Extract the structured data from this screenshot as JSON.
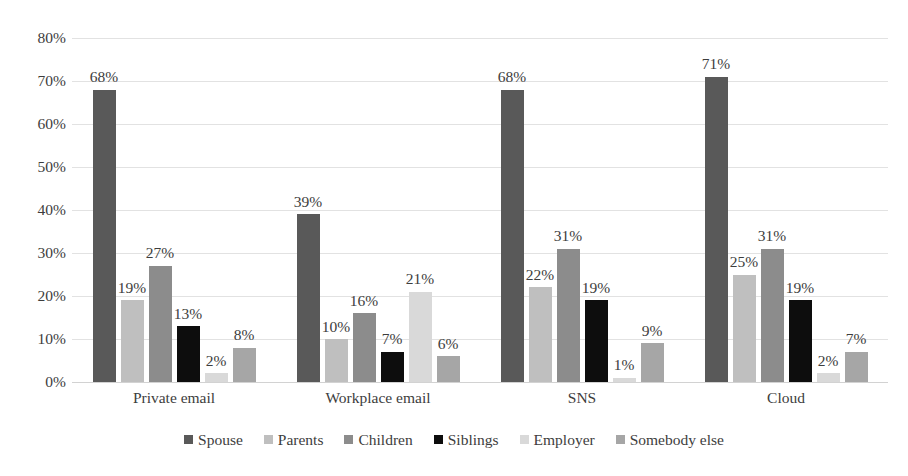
{
  "chart_data": {
    "type": "bar",
    "title": "",
    "subtitle": "",
    "xlabel": "",
    "ylabel": "",
    "ylim": [
      0,
      80
    ],
    "ytick_labels": [
      "80%",
      "70%",
      "60%",
      "50%",
      "40%",
      "30%",
      "20%",
      "10%",
      "0%"
    ],
    "ytick_values": [
      80,
      70,
      60,
      50,
      40,
      30,
      20,
      10,
      0
    ],
    "grid": true,
    "legend_position": "bottom",
    "value_suffix": "%",
    "categories": [
      "Private email",
      "Workplace email",
      "SNS",
      "Cloud"
    ],
    "series": [
      {
        "name": "Spouse",
        "color": "#595959",
        "values": [
          68,
          39,
          68,
          71
        ],
        "labels": [
          "68%",
          "39%",
          "68%",
          "71%"
        ]
      },
      {
        "name": "Parents",
        "color": "#bfbfbf",
        "values": [
          19,
          10,
          22,
          25
        ],
        "labels": [
          "19%",
          "10%",
          "22%",
          "25%"
        ]
      },
      {
        "name": "Children",
        "color": "#8c8c8c",
        "values": [
          27,
          16,
          31,
          31
        ],
        "labels": [
          "27%",
          "16%",
          "31%",
          "31%"
        ]
      },
      {
        "name": "Siblings",
        "color": "#0d0d0d",
        "values": [
          13,
          7,
          19,
          19
        ],
        "labels": [
          "13%",
          "7%",
          "19%",
          "19%"
        ]
      },
      {
        "name": "Employer",
        "color": "#d9d9d9",
        "values": [
          2,
          21,
          1,
          2
        ],
        "labels": [
          "2%",
          "21%",
          "1%",
          "2%"
        ]
      },
      {
        "name": "Somebody else",
        "color": "#a6a6a6",
        "values": [
          8,
          6,
          9,
          7
        ],
        "labels": [
          "8%",
          "6%",
          "9%",
          "7%"
        ]
      }
    ]
  },
  "legend": {
    "items": [
      {
        "label": "Spouse",
        "color": "#595959"
      },
      {
        "label": "Parents",
        "color": "#bfbfbf"
      },
      {
        "label": "Children",
        "color": "#8c8c8c"
      },
      {
        "label": "Siblings",
        "color": "#0d0d0d"
      },
      {
        "label": "Employer",
        "color": "#d9d9d9"
      },
      {
        "label": "Somebody else",
        "color": "#a6a6a6"
      }
    ]
  },
  "style": {
    "background": "#ffffff",
    "gridline_color": "#e2e2e2",
    "axis_text_color": "#3d3d3d"
  }
}
